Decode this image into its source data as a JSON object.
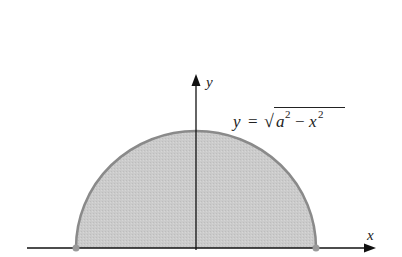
{
  "diagram": {
    "type": "semicircle-region",
    "axes": {
      "x_label": "x",
      "y_label": "y"
    },
    "equation": {
      "lhs": "y",
      "equals": "=",
      "radical": "√",
      "a": "a",
      "a_exp": "2",
      "minus": "−",
      "x": "x",
      "x_exp": "2"
    },
    "colors": {
      "fill": "#c8c8c8",
      "outline": "#8a8a8a",
      "axis": "#111111",
      "endpoint": "#9a9a9a"
    }
  }
}
